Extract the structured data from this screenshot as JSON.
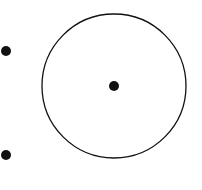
{
  "diagram": {
    "background": "#ffffff",
    "stroke_color": "#111111",
    "circle": {
      "cx": 114,
      "cy": 86,
      "r": 72,
      "stroke_width": 1.3
    },
    "points": [
      {
        "name": "center-point",
        "cx": 114,
        "cy": 86,
        "r": 5
      },
      {
        "name": "outside-point-top",
        "cx": 6,
        "cy": 51,
        "r": 5
      },
      {
        "name": "outside-point-bottom",
        "cx": 6,
        "cy": 155,
        "r": 5
      }
    ]
  }
}
